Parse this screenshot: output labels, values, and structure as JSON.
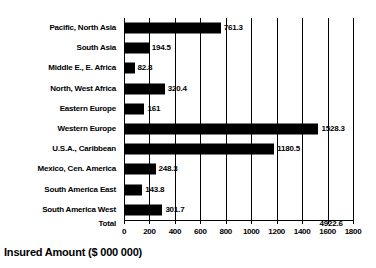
{
  "chart_data": {
    "type": "bar",
    "orientation": "horizontal",
    "title": "",
    "xlabel": "Insured Amount ($ 000 000)",
    "ylabel": "",
    "xlim": [
      0,
      1800
    ],
    "xticks": [
      0,
      200,
      400,
      600,
      800,
      1000,
      1200,
      1400,
      1600,
      1800
    ],
    "xtick_labels": [
      "0",
      "200",
      "400",
      "600",
      "800",
      "1000",
      "1200",
      "1400",
      "1600",
      "1800"
    ],
    "grid": true,
    "grid_axis": "x",
    "legend": false,
    "bar_color": "#000000",
    "categories": [
      "Pacific, North Asia",
      "South Asia",
      "Middle E., E. Africa",
      "North, West Africa",
      "Eastern Europe",
      "Western Europe",
      "U.S.A., Caribbean",
      "Mexico, Cen. America",
      "South America East",
      "South America West"
    ],
    "values": [
      761.3,
      194.5,
      82.8,
      320.4,
      161,
      1528.3,
      1180.5,
      248.3,
      143.8,
      301.7
    ],
    "value_labels": [
      "761.3",
      "194.5",
      "82.8",
      "320.4",
      "161",
      "1528.3",
      "1180.5",
      "248.3",
      "143.8",
      "301.7"
    ],
    "total_label": "Total",
    "total_value": 4922.6,
    "total_value_label": "4922.6"
  },
  "axis": {
    "title": "Insured Amount ($ 000 000)"
  }
}
